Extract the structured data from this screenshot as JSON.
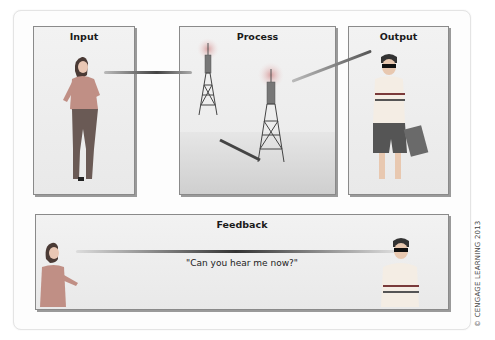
{
  "diagram": {
    "panels": [
      {
        "id": "input",
        "title": "Input",
        "figure": "woman talking on phone"
      },
      {
        "id": "process",
        "title": "Process",
        "figure": "two cell towers"
      },
      {
        "id": "output",
        "title": "Output",
        "figure": "man with sunglasses on phone holding bag"
      },
      {
        "id": "feedback",
        "title": "Feedback",
        "figure": "woman and man on phones"
      }
    ],
    "feedback_quote": "\"Can you hear me now?\"",
    "copyright": "© CENGAGE LEARNING 2013",
    "colors": {
      "panel_border": "#8a8a8a",
      "panel_bg": "#eeeeee",
      "link": "#555555"
    }
  }
}
